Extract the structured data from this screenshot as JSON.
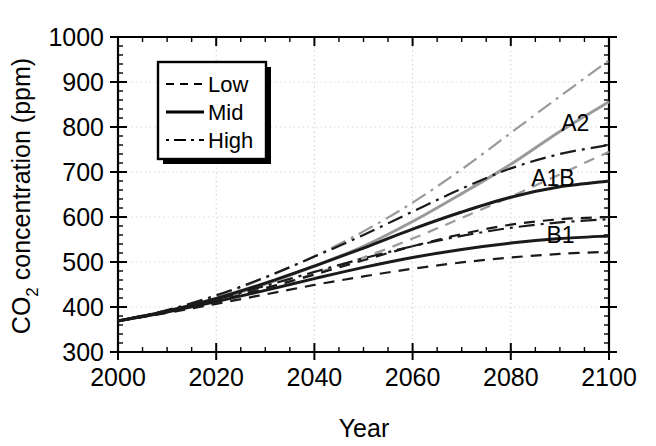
{
  "chart_data": {
    "type": "line",
    "title": "",
    "xlabel": "Year",
    "ylabel": "CO2 concentration (ppm)",
    "ylabel_main": "CO",
    "ylabel_sub": "2",
    "ylabel_rest": " concentration (ppm)",
    "xlim": [
      2000,
      2100
    ],
    "ylim": [
      300,
      1000
    ],
    "xticks": [
      2000,
      2020,
      2040,
      2060,
      2080,
      2100
    ],
    "xtick_labels": [
      "2000",
      "2020",
      "2040",
      "2060",
      "2080",
      "2100"
    ],
    "xminor_step": 5,
    "yticks": [
      300,
      400,
      500,
      600,
      700,
      800,
      900,
      1000
    ],
    "ytick_labels": [
      "300",
      "400",
      "500",
      "600",
      "700",
      "800",
      "900",
      "1000"
    ],
    "yminor_step": 20,
    "grid": "light dotted major gridlines",
    "legend": {
      "position": "upper-left-inside",
      "entries": [
        {
          "label": "Low",
          "style": "dashed"
        },
        {
          "label": "Mid",
          "style": "solid"
        },
        {
          "label": "High",
          "style": "dash-dot"
        }
      ]
    },
    "annotations": [
      {
        "text": "A2",
        "x": 2096,
        "y": 810,
        "color": "#9a9a9a"
      },
      {
        "text": "A1B",
        "x": 2093,
        "y": 686,
        "color": "#1a1a1a"
      },
      {
        "text": "B1",
        "x": 2093,
        "y": 560,
        "color": "#1a1a1a"
      }
    ],
    "x": [
      2000,
      2010,
      2020,
      2030,
      2040,
      2050,
      2060,
      2070,
      2080,
      2090,
      2100
    ],
    "series": [
      {
        "name": "A2 Mid",
        "scenario": "A2",
        "style": "solid",
        "color": "#9a9a9a",
        "values": [
          369,
          390,
          417,
          451,
          491,
          535,
          590,
          652,
          717,
          790,
          856
        ]
      },
      {
        "name": "A2 Low",
        "scenario": "A2",
        "style": "dashed",
        "color": "#9a9a9a",
        "values": [
          369,
          388,
          411,
          441,
          474,
          510,
          552,
          598,
          645,
          695,
          745
        ]
      },
      {
        "name": "A2 High",
        "scenario": "A2",
        "style": "dash-dot",
        "color": "#9a9a9a",
        "values": [
          369,
          392,
          424,
          465,
          513,
          568,
          632,
          706,
          787,
          868,
          948
        ]
      },
      {
        "name": "A1B Mid",
        "scenario": "A1B",
        "style": "solid",
        "color": "#1a1a1a",
        "values": [
          369,
          391,
          419,
          453,
          491,
          531,
          573,
          611,
          644,
          667,
          680
        ]
      },
      {
        "name": "A1B Low",
        "scenario": "A1B",
        "style": "dashed",
        "color": "#1a1a1a",
        "values": [
          369,
          389,
          413,
          442,
          472,
          504,
          535,
          562,
          583,
          595,
          600
        ]
      },
      {
        "name": "A1B High",
        "scenario": "A1B",
        "style": "dash-dot",
        "color": "#1a1a1a",
        "values": [
          369,
          393,
          426,
          466,
          512,
          560,
          612,
          663,
          708,
          740,
          760
        ]
      },
      {
        "name": "B1 Mid",
        "scenario": "B1",
        "style": "solid",
        "color": "#1a1a1a",
        "values": [
          369,
          389,
          412,
          437,
          463,
          488,
          510,
          528,
          542,
          552,
          558
        ]
      },
      {
        "name": "B1 Low",
        "scenario": "B1",
        "style": "dashed",
        "color": "#1a1a1a",
        "values": [
          369,
          387,
          407,
          428,
          449,
          468,
          485,
          499,
          510,
          518,
          523
        ]
      },
      {
        "name": "B1 High",
        "scenario": "B1",
        "style": "dash-dot",
        "color": "#1a1a1a",
        "values": [
          369,
          391,
          417,
          447,
          478,
          508,
          535,
          558,
          576,
          588,
          595
        ]
      }
    ]
  }
}
